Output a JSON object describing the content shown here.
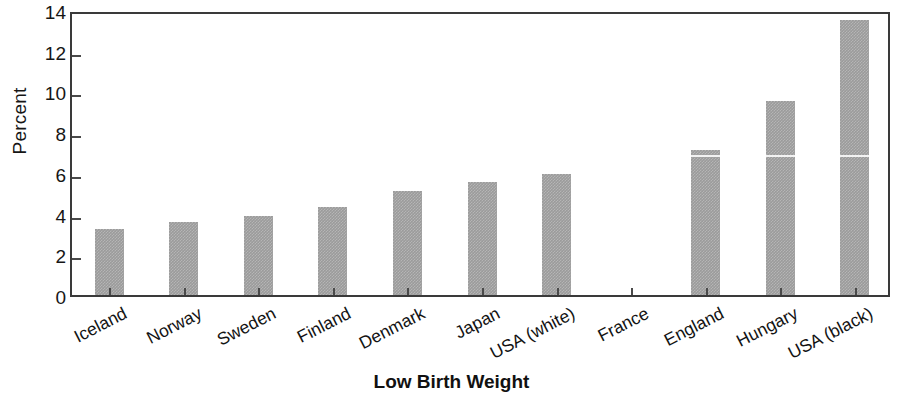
{
  "chart_data": {
    "type": "bar",
    "title": "",
    "xlabel": "Low Birth Weight",
    "ylabel": "Percent",
    "ylim": [
      0,
      14
    ],
    "yticks": [
      0,
      2,
      4,
      6,
      8,
      10,
      12,
      14
    ],
    "grid": false,
    "legend": null,
    "categories": [
      "Iceland",
      "Norway",
      "Sweden",
      "Finland",
      "Denmark",
      "Japan",
      "USA (white)",
      "France",
      "England",
      "Hungary",
      "USA (black)"
    ],
    "values": [
      3.25,
      3.6,
      3.9,
      4.3,
      5.1,
      5.55,
      5.95,
      0,
      7.1,
      9.55,
      13.5
    ]
  },
  "axis": {
    "y_title": "Percent",
    "x_title": "Low Birth Weight",
    "y_tick_labels": [
      "0",
      "2",
      "4",
      "6",
      "8",
      "10",
      "12",
      "14"
    ]
  },
  "style": {
    "bar_color": "#9b9b9b",
    "frame_color": "#3a3a3a",
    "text_color": "#161616",
    "background": "#ffffff"
  }
}
